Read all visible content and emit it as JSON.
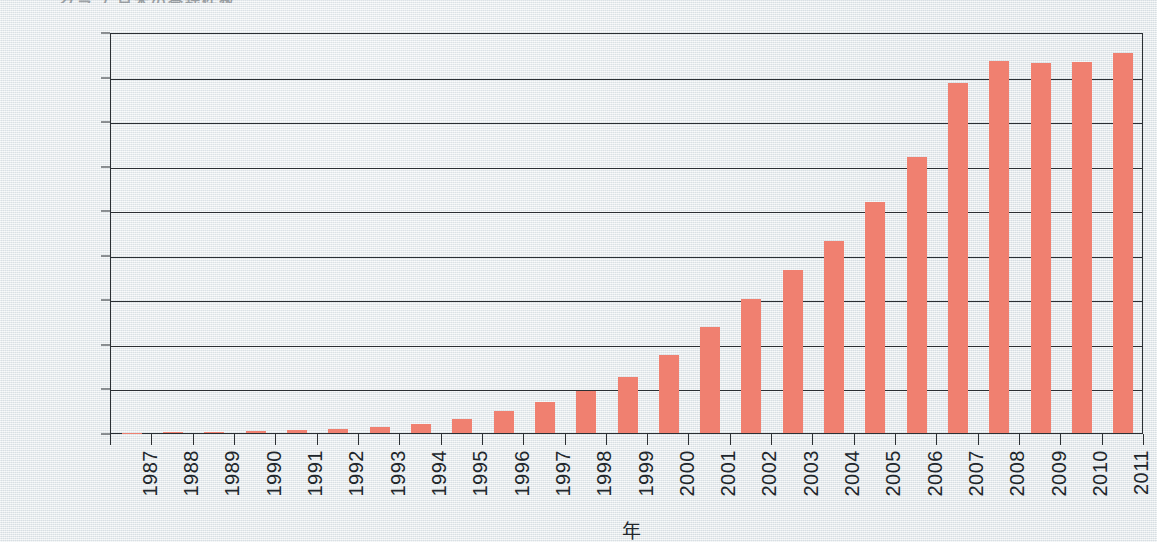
{
  "chart_data": {
    "type": "bar",
    "title": "",
    "xlabel": "年",
    "ylabel": "",
    "ylim": [
      0,
      18000
    ],
    "ytick_step": 2000,
    "grid": true,
    "legend": null,
    "bar_color": "#f08070",
    "categories": [
      "1987",
      "1988",
      "1989",
      "1990",
      "1991",
      "1992",
      "1993",
      "1994",
      "1995",
      "1996",
      "1997",
      "1998",
      "1999",
      "2000",
      "2001",
      "2002",
      "2003",
      "2004",
      "2005",
      "2006",
      "2007",
      "2008",
      "2009",
      "2010",
      "2011"
    ],
    "values": [
      20,
      30,
      60,
      90,
      130,
      180,
      250,
      400,
      650,
      1000,
      1400,
      1900,
      2500,
      3500,
      4750,
      6000,
      7300,
      8600,
      10350,
      12400,
      15700,
      16700,
      16600,
      16650,
      17050
    ],
    "ytick_labels": [
      "18,000",
      "16,000",
      "14,000",
      "12,000",
      "10,000",
      "8,000",
      "6,000",
      "4,000",
      "2,000",
      "0"
    ],
    "ytick_values": [
      18000,
      16000,
      14000,
      12000,
      10000,
      8000,
      6000,
      4000,
      2000,
      0
    ]
  },
  "axes": {
    "x_title": "年"
  },
  "header": {
    "cropped_title": "グラフ  日本の登録件数"
  },
  "colors": {
    "bar": "#f08070",
    "axis": "#2b2f33",
    "background": "#e3e8ea",
    "text": "#20262b"
  }
}
